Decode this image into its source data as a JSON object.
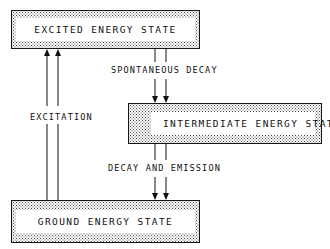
{
  "diagram": {
    "type": "energy-level-transition-flow",
    "title_visible": false,
    "background_color": "#ffffff",
    "ink_color": "#101010",
    "fill_pattern": "stipple-dots",
    "boxes": [
      {
        "id": "excited",
        "label": "EXCITED ENERGY STATE",
        "x": 11,
        "y": 10,
        "width": 189,
        "height": 39,
        "inner": {
          "x": 5,
          "y": 6,
          "width": 179,
          "height": 27
        }
      },
      {
        "id": "intermediate",
        "label": "INTERMEDIATE ENERGY STATE",
        "x": 128,
        "y": 103,
        "width": 194,
        "height": 41,
        "inner": {
          "x": 24,
          "y": 7,
          "width": 164,
          "height": 27
        }
      },
      {
        "id": "ground",
        "label": "GROUND ENERGY STATE",
        "x": 11,
        "y": 200,
        "width": 189,
        "height": 43,
        "inner": {
          "x": 5,
          "y": 8,
          "width": 179,
          "height": 27
        }
      }
    ],
    "flows": [
      {
        "id": "excitation",
        "label": "EXCITATION",
        "from": "ground",
        "to": "excited",
        "direction": "up",
        "arrow_count": 2,
        "label_x": 26,
        "label_y": 115,
        "line_xs": [
          47,
          58
        ],
        "line_top": 49,
        "line_bottom": 200
      },
      {
        "id": "spontaneous-decay",
        "label": "SPONTANEOUS DECAY",
        "from": "excited",
        "to": "intermediate",
        "direction": "down",
        "arrow_count": 2,
        "label_x": 112,
        "label_y": 68,
        "line_xs": [
          155,
          166
        ],
        "line_top": 49,
        "line_bottom": 103
      },
      {
        "id": "decay-and-emission",
        "label": "DECAY AND EMISSION",
        "from": "intermediate",
        "to": "ground",
        "direction": "down",
        "arrow_count": 2,
        "label_x": 108,
        "label_y": 166,
        "line_xs": [
          155,
          166
        ],
        "line_top": 144,
        "line_bottom": 200
      }
    ]
  }
}
